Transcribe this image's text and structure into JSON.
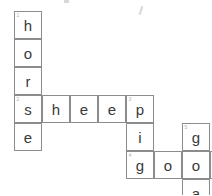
{
  "puzzle": {
    "title": "animal-crossword",
    "grid": {
      "cell_size": 28,
      "origin_x": 14,
      "origin_y": 11,
      "columns": 7,
      "rows": 7,
      "line_color": "#8c8c8c",
      "letter_color": "#3a3a3a",
      "number_color": "#b0b0b0",
      "background": "#ffffff"
    },
    "entries": [
      {
        "number": "1",
        "answer": "horse",
        "direction": "down",
        "start_col": 0,
        "start_row": 0
      },
      {
        "number": "2",
        "answer": "sheep",
        "direction": "across",
        "start_col": 0,
        "start_row": 3
      },
      {
        "number": "3",
        "answer": "pig",
        "direction": "down",
        "start_col": 4,
        "start_row": 3
      },
      {
        "number": "4",
        "answer": "goose",
        "direction": "across",
        "start_col": 4,
        "start_row": 5
      },
      {
        "number": "5",
        "answer": "goat",
        "direction": "down",
        "start_col": 6,
        "start_row": 4
      },
      {
        "number": "6",
        "answer": "cat",
        "direction": "across",
        "start_col": 4,
        "start_row": 8
      }
    ],
    "cells": [
      {
        "col": 0,
        "row": 0,
        "letter": "h",
        "number": "1"
      },
      {
        "col": 0,
        "row": 1,
        "letter": "o",
        "number": ""
      },
      {
        "col": 0,
        "row": 2,
        "letter": "r",
        "number": ""
      },
      {
        "col": 0,
        "row": 3,
        "letter": "s",
        "number": "2"
      },
      {
        "col": 0,
        "row": 4,
        "letter": "e",
        "number": ""
      },
      {
        "col": 1,
        "row": 3,
        "letter": "h",
        "number": ""
      },
      {
        "col": 2,
        "row": 3,
        "letter": "e",
        "number": ""
      },
      {
        "col": 3,
        "row": 3,
        "letter": "e",
        "number": ""
      },
      {
        "col": 4,
        "row": 3,
        "letter": "p",
        "number": "3"
      },
      {
        "col": 4,
        "row": 4,
        "letter": "i",
        "number": ""
      },
      {
        "col": 4,
        "row": 5,
        "letter": "g",
        "number": "4"
      },
      {
        "col": 5,
        "row": 5,
        "letter": "o",
        "number": ""
      },
      {
        "col": 6,
        "row": 5,
        "letter": "o",
        "number": ""
      },
      {
        "col": 7,
        "row": 5,
        "letter": "s",
        "number": ""
      },
      {
        "col": 8,
        "row": 5,
        "letter": "e",
        "number": ""
      },
      {
        "col": 6,
        "row": 4,
        "letter": "g",
        "number": "5"
      },
      {
        "col": 6,
        "row": 6,
        "letter": "a",
        "number": ""
      },
      {
        "col": 6,
        "row": 7,
        "letter": "t",
        "number": ""
      },
      {
        "col": 4,
        "row": 7,
        "letter": "c",
        "number": "6"
      },
      {
        "col": 5,
        "row": 7,
        "letter": "a",
        "number": ""
      }
    ]
  }
}
